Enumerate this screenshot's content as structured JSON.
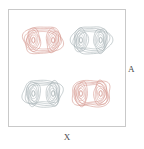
{
  "figure": {
    "title": "",
    "background_color": "#ffffff",
    "frame_color": "#c9c9c9"
  },
  "axes": {
    "xlabel": "X",
    "ylabel": "A",
    "xlabel_name": "x-axis-label",
    "ylabel_name": "y-axis-label",
    "tick_labels_x": [],
    "tick_labels_y": [],
    "grid": false
  },
  "legend": {
    "visible": false,
    "entries": []
  },
  "colors": {
    "positive": "#cf8a80",
    "negative": "#9aa6aa",
    "frame": "#c9c9c9",
    "text": "#4a4a4a",
    "background": "#ffffff"
  },
  "chart_data": {
    "type": "contour",
    "title": "",
    "xlabel": "X",
    "ylabel": "A",
    "grid": false,
    "legend_position": "none",
    "xlim": [
      0,
      1
    ],
    "ylim": [
      0,
      1
    ],
    "contour_levels": [
      1,
      2,
      3,
      4,
      5,
      6,
      7,
      8
    ],
    "n_levels": 8,
    "cells": [
      {
        "name": "top-left",
        "sign": "positive",
        "color": "#cf8a80",
        "center_x": 0.29,
        "center_y": 0.74,
        "lobe_centers": [
          [
            0.21,
            0.74
          ],
          [
            0.38,
            0.74
          ]
        ],
        "peak_value": 8
      },
      {
        "name": "top-right",
        "sign": "negative",
        "color": "#9aa6aa",
        "center_x": 0.71,
        "center_y": 0.74,
        "lobe_centers": [
          [
            0.62,
            0.74
          ],
          [
            0.79,
            0.74
          ]
        ],
        "peak_value": -8
      },
      {
        "name": "bottom-left",
        "sign": "negative",
        "color": "#9aa6aa",
        "center_x": 0.29,
        "center_y": 0.28,
        "lobe_centers": [
          [
            0.21,
            0.28
          ],
          [
            0.38,
            0.28
          ]
        ],
        "peak_value": -8
      },
      {
        "name": "bottom-right",
        "sign": "positive",
        "color": "#cf8a80",
        "center_x": 0.71,
        "center_y": 0.28,
        "lobe_centers": [
          [
            0.62,
            0.28
          ],
          [
            0.79,
            0.28
          ]
        ],
        "peak_value": 8
      }
    ]
  }
}
